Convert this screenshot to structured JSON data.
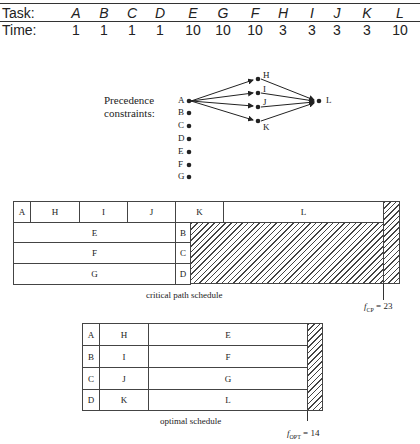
{
  "task_table": {
    "row_labels": {
      "task": "Task:",
      "time": "Time:"
    },
    "tasks": [
      "A",
      "B",
      "C",
      "D",
      "E",
      "G",
      "F",
      "H",
      "I",
      "J",
      "K",
      "L"
    ],
    "times": [
      "1",
      "1",
      "1",
      "1",
      "10",
      "10",
      "10",
      "3",
      "3",
      "3",
      "3",
      "10"
    ]
  },
  "precedence": {
    "label_line1": "Precedence",
    "label_line2": "constraints:",
    "left_nodes": [
      "A",
      "B",
      "C",
      "D",
      "E",
      "F",
      "G"
    ],
    "middle_nodes": [
      "H",
      "I",
      "J",
      "K"
    ],
    "right_node": "L",
    "edges": [
      [
        "A",
        "H"
      ],
      [
        "A",
        "I"
      ],
      [
        "A",
        "J"
      ],
      [
        "A",
        "K"
      ],
      [
        "H",
        "L"
      ],
      [
        "I",
        "L"
      ],
      [
        "J",
        "L"
      ],
      [
        "K",
        "L"
      ]
    ]
  },
  "critical_path_schedule": {
    "caption": "critical path schedule",
    "rows": [
      [
        "A",
        "H",
        "I",
        "J",
        "K",
        "L"
      ],
      [
        "E",
        "B"
      ],
      [
        "F",
        "C"
      ],
      [
        "G",
        "D"
      ]
    ],
    "finish_label_f": "f",
    "finish_label_sub": "CP",
    "finish_label_value": "= 23"
  },
  "optimal_schedule": {
    "caption": "optimal schedule",
    "rows": [
      [
        "A",
        "H",
        "E"
      ],
      [
        "B",
        "I",
        "F"
      ],
      [
        "C",
        "J",
        "G"
      ],
      [
        "D",
        "K",
        "L"
      ]
    ],
    "finish_label_f": "f",
    "finish_label_sub": "OPT",
    "finish_label_value": "= 14"
  }
}
